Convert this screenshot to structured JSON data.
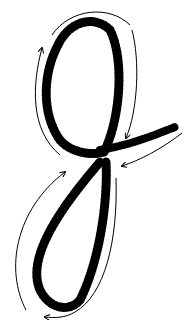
{
  "figure": {
    "stroke_color": "#000000",
    "background": "#ffffff",
    "upper_loop": {
      "cx": 90,
      "cy": 92,
      "rx": 40,
      "ry": 62
    },
    "lower_loop": {
      "cx": 62,
      "cy": 250,
      "rx": 30,
      "ry": 75
    },
    "arrows": [
      {
        "name": "upper-left-arrow",
        "direction": "up"
      },
      {
        "name": "upper-right-arrow",
        "direction": "down"
      },
      {
        "name": "crossing-right-arrow",
        "direction": "left"
      },
      {
        "name": "lower-left-arrow",
        "direction": "up"
      },
      {
        "name": "bottom-arrow",
        "direction": "left"
      }
    ]
  }
}
